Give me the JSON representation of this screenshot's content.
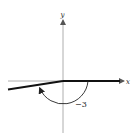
{
  "diagram": {
    "axes": {
      "x_label": "x",
      "y_label": "y"
    },
    "angle": {
      "label": "−3",
      "value_radians": -3,
      "direction": "clockwise",
      "initial_side": "positive x-axis",
      "terminal_side_quadrant": "III"
    },
    "colors": {
      "axes": "#9a9a9a",
      "sides": "#111111",
      "arc": "#222222"
    }
  }
}
